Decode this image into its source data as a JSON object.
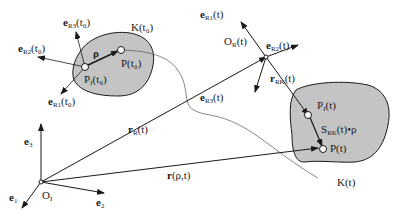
{
  "diagram": {
    "type": "rigid-body kinematics",
    "colors": {
      "body_fill": "#c4c4c4",
      "stroke": "#1a1a1a",
      "background": "#ffffff"
    },
    "inertial_frame": {
      "origin": "O",
      "origin_sub": "I",
      "axes": [
        {
          "base": "e",
          "sub": "1"
        },
        {
          "base": "e",
          "sub": "2"
        },
        {
          "base": "e",
          "sub": "3"
        }
      ]
    },
    "body_t0": {
      "label": "K(t₀)",
      "ref_point": {
        "base": "P",
        "sub": "I",
        "arg": "(t₀)"
      },
      "point": "P(t₀)",
      "rho": "ρ",
      "axes": [
        {
          "base": "e",
          "sub": "R1",
          "arg": "(t₀)"
        },
        {
          "base": "e",
          "sub": "R2",
          "arg": "(t₀)"
        },
        {
          "base": "e",
          "sub": "R3",
          "arg": "(t₀)"
        }
      ]
    },
    "moving_frame": {
      "origin": {
        "base": "O",
        "sub": "R",
        "arg": "(t)"
      },
      "axes": [
        {
          "base": "e",
          "sub": "R1",
          "arg": "(t)"
        },
        {
          "base": "e",
          "sub": "R2",
          "arg": "(t)"
        },
        {
          "base": "e",
          "sub": "R3",
          "arg": "(t)"
        }
      ]
    },
    "body_t": {
      "label": "K(t)",
      "ref_point": {
        "base": "P",
        "sub": "I",
        "arg": "(t)"
      },
      "point": "P(t)",
      "rotated_rho": {
        "base": "S",
        "sub": "RK",
        "arg": "(t)•ρ"
      }
    },
    "vectors": {
      "r_R": {
        "base": "r",
        "sub": "R",
        "arg": "(t)"
      },
      "r_RK": {
        "base": "r",
        "sub": "RK",
        "arg": "(t)"
      },
      "r": {
        "base": "r",
        "arg": "(ρ,t)"
      }
    }
  }
}
